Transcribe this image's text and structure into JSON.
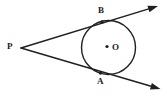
{
  "figure": {
    "background_color": "#ffffff",
    "stroke_color": "#231f20",
    "labels": {
      "external_point": "P",
      "upper_tangent_point": "B",
      "lower_tangent_point": "A",
      "centre": "O"
    },
    "geometry": {
      "circle": {
        "cx": 108.5,
        "cy": 47.5,
        "r": 27.0
      },
      "centre_dot": {
        "cx": 107.0,
        "cy": 46.5,
        "r": 1.6
      },
      "external_point": {
        "x": 21.0,
        "y": 48.0
      },
      "tangent_point_upper": {
        "x": 102.0,
        "y": 22.0
      },
      "tangent_point_lower": {
        "x": 100.5,
        "y": 73.0
      },
      "ray_upper_end": {
        "x": 158.0,
        "y": 6.0
      },
      "ray_lower_end": {
        "x": 160.5,
        "y": 89.0
      },
      "stroke_width": 1.5
    }
  }
}
